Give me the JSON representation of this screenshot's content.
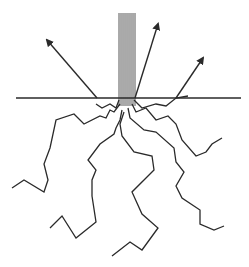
{
  "diagram": {
    "colors": {
      "background": "#ffffff",
      "stroke": "#2a2a2a",
      "beam": "#555555"
    },
    "surface": {
      "x1": 16,
      "y1": 98,
      "x2": 241,
      "y2": 98
    },
    "beam": {
      "top": 13,
      "bottom": 98,
      "lines_x": [
        119,
        121,
        123,
        125,
        127,
        129,
        131,
        133,
        135
      ]
    },
    "reflected_rays": [
      {
        "from": [
          97,
          98
        ],
        "to": [
          47,
          40
        ]
      },
      {
        "from": [
          135,
          98
        ],
        "to": [
          158,
          24
        ]
      },
      {
        "from": [
          176,
          98
        ],
        "to": [
          203,
          58
        ]
      }
    ],
    "scatter_paths": [
      "119,100 116,108 110,104 102,108 96,104",
      "120,104 114,112 110,110 106,118 100,116 84,124 74,114 56,120 50,148 44,164 48,180 44,192 24,180 12,188",
      "122,110 120,120 116,128 114,134 100,144 88,160 96,170 92,180 92,196 96,222 76,238 62,216 50,228",
      "124,112 120,124 122,136 134,152 152,156 154,170 132,192 142,214 158,228 142,250 130,242 112,256",
      "128,108 130,118 144,130 156,132 174,148 176,162 184,172 176,186 182,198 200,210 200,224 214,230 224,226",
      "132,104 136,112 146,108 156,120 168,116 176,124 182,140 196,156 206,152 212,144 222,138",
      "134,100 142,108 156,104 166,106 176,98 188,96"
    ]
  }
}
